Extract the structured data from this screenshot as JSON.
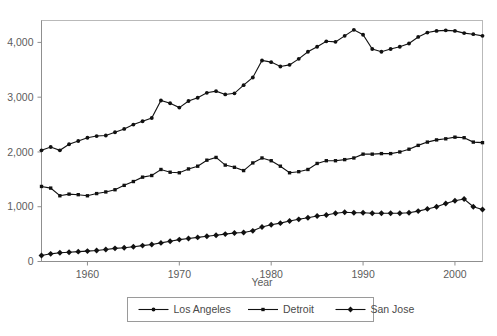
{
  "chart_data": {
    "type": "line",
    "title": "",
    "xlabel": "Year",
    "ylabel": "",
    "xlim": [
      1955,
      2003
    ],
    "ylim": [
      0,
      4400
    ],
    "grid": false,
    "legend_position": "bottom",
    "xticks": [
      1960,
      1970,
      1980,
      1990,
      2000
    ],
    "xtick_labels": [
      "1960",
      "1970",
      "1980",
      "1990",
      "2000"
    ],
    "yticks": [
      0,
      1000,
      2000,
      3000,
      4000
    ],
    "ytick_labels": [
      "0",
      "1,000",
      "2,000",
      "3,000",
      "4,000"
    ],
    "x": [
      1955,
      1956,
      1957,
      1958,
      1959,
      1960,
      1961,
      1962,
      1963,
      1964,
      1965,
      1966,
      1967,
      1968,
      1969,
      1970,
      1971,
      1972,
      1973,
      1974,
      1975,
      1976,
      1977,
      1978,
      1979,
      1980,
      1981,
      1982,
      1983,
      1984,
      1985,
      1986,
      1987,
      1988,
      1989,
      1990,
      1991,
      1992,
      1993,
      1994,
      1995,
      1996,
      1997,
      1998,
      1999,
      2000,
      2001,
      2002,
      2003
    ],
    "series": [
      {
        "name": "Los Angeles",
        "marker": "circle",
        "color": "#111111",
        "values": [
          2030,
          2090,
          2030,
          2140,
          2200,
          2260,
          2290,
          2300,
          2360,
          2420,
          2500,
          2560,
          2620,
          2940,
          2890,
          2810,
          2930,
          2990,
          3080,
          3110,
          3050,
          3070,
          3220,
          3360,
          3670,
          3640,
          3560,
          3590,
          3700,
          3830,
          3920,
          4020,
          4010,
          4120,
          4230,
          4140,
          3880,
          3830,
          3880,
          3920,
          3980,
          4100,
          4180,
          4210,
          4220,
          4210,
          4170,
          4150,
          4120
        ]
      },
      {
        "name": "Detroit",
        "marker": "square",
        "color": "#111111",
        "values": [
          1370,
          1340,
          1200,
          1230,
          1220,
          1200,
          1240,
          1270,
          1310,
          1390,
          1460,
          1540,
          1570,
          1680,
          1630,
          1620,
          1690,
          1740,
          1850,
          1900,
          1760,
          1720,
          1660,
          1800,
          1890,
          1840,
          1740,
          1620,
          1640,
          1680,
          1790,
          1840,
          1840,
          1860,
          1890,
          1960,
          1960,
          1970,
          1970,
          2000,
          2050,
          2120,
          2180,
          2220,
          2240,
          2270,
          2260,
          2180,
          2170
        ]
      },
      {
        "name": "San Jose",
        "marker": "diamond",
        "color": "#111111",
        "values": [
          110,
          140,
          160,
          170,
          180,
          190,
          200,
          220,
          240,
          250,
          270,
          290,
          310,
          340,
          370,
          400,
          420,
          440,
          460,
          480,
          500,
          520,
          530,
          560,
          630,
          670,
          700,
          740,
          770,
          800,
          830,
          850,
          880,
          900,
          890,
          890,
          880,
          880,
          880,
          880,
          890,
          920,
          960,
          1000,
          1060,
          1110,
          1140,
          1000,
          950
        ]
      }
    ]
  },
  "legend": {
    "entries": [
      {
        "label": "Los Angeles",
        "marker": "circle"
      },
      {
        "label": "Detroit",
        "marker": "square"
      },
      {
        "label": "San Jose",
        "marker": "diamond"
      }
    ]
  }
}
